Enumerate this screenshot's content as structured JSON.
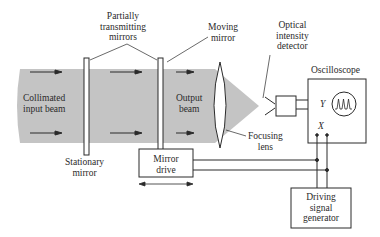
{
  "diagram": {
    "colors": {
      "beam": "#c4c4c4",
      "lines": "#2a2a2a",
      "background": "#ffffff"
    },
    "labels": {
      "partially_transmitting_mirrors": [
        "Partially",
        "transmitting",
        "mirrors"
      ],
      "moving_mirror": [
        "Moving",
        "mirror"
      ],
      "optical_intensity_detector": [
        "Optical",
        "intensity",
        "detector"
      ],
      "oscilloscope": "Oscilloscope",
      "collimated_input_beam": [
        "Collimated",
        "input beam"
      ],
      "output_beam": [
        "Output",
        "beam"
      ],
      "stationary_mirror": [
        "Stationary",
        "mirror"
      ],
      "mirror_drive": [
        "Mirror",
        "drive"
      ],
      "focusing_lens": [
        "Focusing",
        "lens"
      ],
      "driving_signal_generator": [
        "Driving",
        "signal",
        "generator"
      ],
      "y_input": "Y",
      "x_input": "X"
    },
    "icons": {
      "beam_arrows": "right-arrow",
      "mirror_motion": "double-headed-arrow",
      "scope_trace": "pulse-train"
    }
  }
}
